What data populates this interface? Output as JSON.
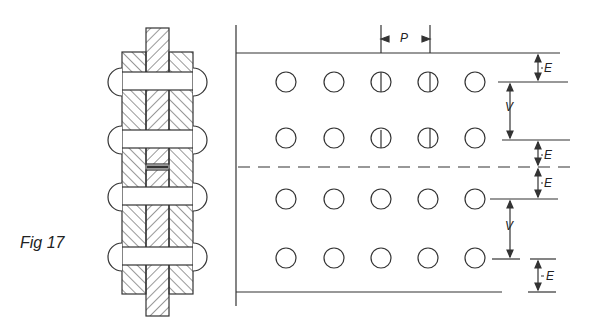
{
  "figure": {
    "label": "Fig 17",
    "dimension_labels": {
      "pitch": "P",
      "edge_top": "E",
      "vertical_1": "V",
      "edge_mid_upper": "E",
      "edge_mid_lower": "E",
      "vertical_2": "V",
      "edge_bottom": "E"
    }
  },
  "layout": {
    "rivet_columns_x": [
      286,
      334,
      381,
      428,
      475
    ],
    "rivet_rows_y": [
      82,
      138,
      199,
      258
    ],
    "rivet_radius": 10,
    "line_color": "#333333"
  }
}
